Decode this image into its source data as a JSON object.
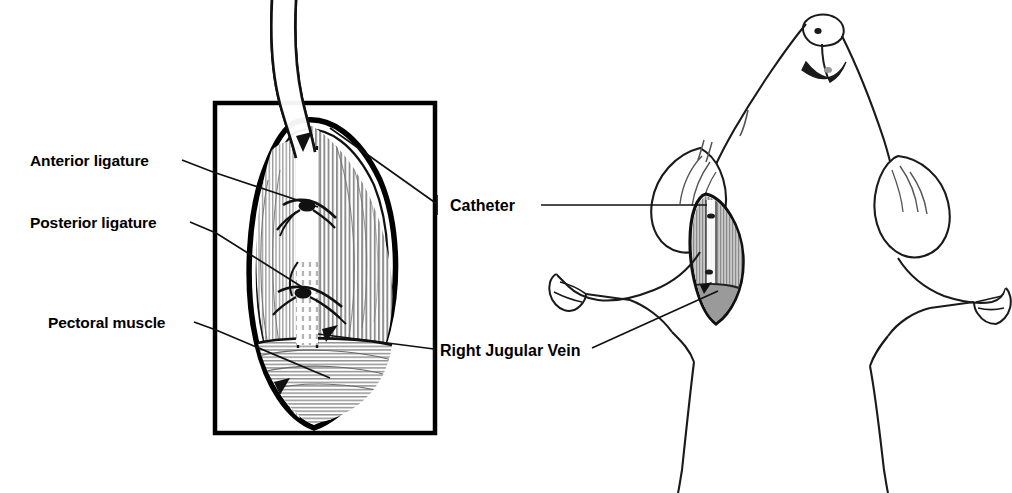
{
  "figure": {
    "background_color": "#ffffff",
    "ink_color": "#111111",
    "width": 1012,
    "height": 493
  },
  "inset_panel": {
    "name": "surgical-detail-inset",
    "frame": {
      "x": 215,
      "y": 103,
      "width": 220,
      "height": 330
    },
    "border_color": "#000000",
    "border_width": 4.5,
    "description": "Magnified view of the surgical incision showing the catheter entering the right jugular vein between two ligatures, surrounded by striated pectoral muscle."
  },
  "labels": [
    {
      "id": "anterior-ligature",
      "text": "Anterior ligature",
      "side": "left",
      "text_x": 30,
      "text_y": 166,
      "font": "humanist",
      "leader": "M 182,160 L 213,172 L 318,207"
    },
    {
      "id": "posterior-ligature",
      "text": "Posterior ligature",
      "side": "left",
      "text_x": 30,
      "text_y": 228,
      "font": "humanist",
      "leader": "M 190,222 L 216,233 L 310,292"
    },
    {
      "id": "pectoral-muscle",
      "text": "Pectoral muscle",
      "side": "left",
      "text_x": 48,
      "text_y": 328,
      "font": "humanist",
      "leader": "M 194,322 L 216,330 L 330,378"
    },
    {
      "id": "catheter",
      "text": "Catheter",
      "side": "right",
      "text_x": 450,
      "text_y": 211,
      "font": "grotesque",
      "leader": "M 330,128 L 437,204 M 437,196 L 437,214 M 541,205 L 707,205",
      "points_to": "catheter tube entering incision"
    },
    {
      "id": "right-jugular-vein",
      "text": "Right Jugular Vein",
      "side": "right",
      "text_x": 440,
      "text_y": 356,
      "font": "grotesque",
      "leader": "M 318,334 L 434,349 M 434,340 L 434,358 M 592,348 L 718,291",
      "points_to": "exposed jugular vein"
    }
  ],
  "animal_figure": {
    "name": "rat-ventral-view",
    "description": "Line drawing of a rat viewed from below, head tilted upward, forelimbs splayed to both sides, with an open surgical site on the right side of the neck.",
    "parts": [
      "snout",
      "nostrils",
      "mouth",
      "left-ear",
      "right-ear",
      "neck",
      "left-forelimb",
      "right-forelimb",
      "left-paw",
      "right-paw",
      "torso",
      "surgical-incision"
    ]
  },
  "colors": {
    "ink": "#111111",
    "muscle_shading": "#9e9e9e",
    "muscle_light": "#c8c8c8",
    "tissue_mid": "#b0b0b0",
    "white": "#ffffff"
  }
}
